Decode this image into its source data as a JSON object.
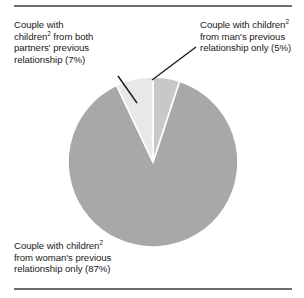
{
  "figure": {
    "footnote_marker": "2",
    "rules": {
      "top": true,
      "bottom": true
    }
  },
  "labels": {
    "both": {
      "line1": "Couple with",
      "line2_pre": "children",
      "line2_post": " from both",
      "line3": "partners' previous",
      "line4": "relationship (7%)"
    },
    "man": {
      "line1_pre": "Couple with children",
      "line1_post": "",
      "line2": "from man's previous",
      "line3": "relationship only (5%)"
    },
    "woman": {
      "line1_pre": "Couple with children",
      "line1_post": "",
      "line2": "from woman's previous",
      "line3": "relationship only (87%)"
    }
  },
  "chart_data": {
    "type": "pie",
    "title": "",
    "xlabel": "",
    "ylabel": "",
    "legend_position": "callout-labels",
    "start_angle_deg": 0,
    "direction": "clockwise",
    "center": {
      "x": 153,
      "y": 162
    },
    "radius": 85,
    "separator_color": "#ffffff",
    "categories": [
      "Couple with children from man's previous relationship only",
      "Couple with children from woman's previous relationship only",
      "Couple with children from both partners' previous relationship"
    ],
    "values": [
      5,
      87,
      7
    ],
    "value_labels": [
      "5%",
      "87%",
      "7%"
    ],
    "colors": [
      "#c8c8c8",
      "#a8a8a8",
      "#e8e8e8"
    ],
    "slices": [
      {
        "name": "man-previous-only",
        "label": "Couple with children from man's previous relationship only (5%)",
        "value": 5,
        "color": "#c8c8c8",
        "start_deg": 0,
        "end_deg": 18
      },
      {
        "name": "woman-previous-only",
        "label": "Couple with children from woman's previous relationship only (87%)",
        "value": 87,
        "color": "#a8a8a8",
        "start_deg": 18,
        "end_deg": 331.2
      },
      {
        "name": "both-partners-previous",
        "label": "Couple with children from both partners' previous relationship (7%)",
        "value": 7,
        "color": "#e8e8e8",
        "start_deg": 331.2,
        "end_deg": 360
      }
    ],
    "leader_lines": [
      {
        "name": "leader-both",
        "from": [
          118,
          76
        ],
        "to": [
          137,
          103
        ]
      },
      {
        "name": "leader-man",
        "from": [
          196,
          47
        ],
        "to": [
          152,
          80
        ]
      }
    ]
  }
}
